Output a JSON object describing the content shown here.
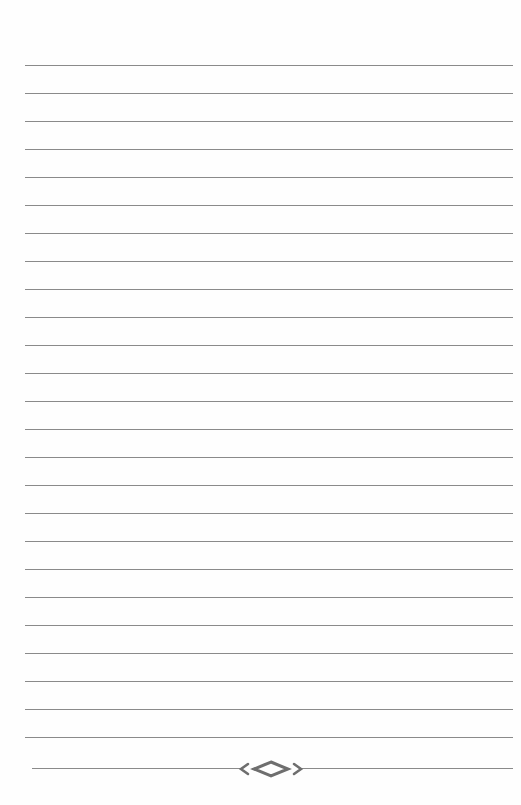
{
  "page": {
    "type": "lined-notebook-page",
    "background": "#fefefe",
    "line_color": "#8a8a8a",
    "line_count": 26,
    "first_line_y": 65,
    "line_spacing": 28,
    "line_left": 25,
    "line_right": 513
  },
  "ornament": {
    "name": "diamond-flourish",
    "color": "#6e6e6e",
    "y": 768
  }
}
